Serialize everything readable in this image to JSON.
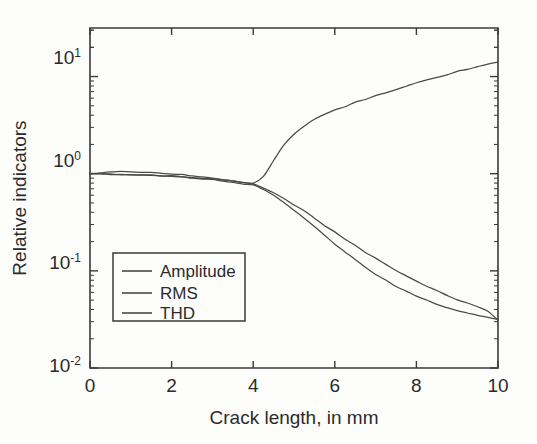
{
  "chart_data": {
    "type": "line",
    "title": "",
    "xlabel": "Crack length, in mm",
    "ylabel": "Relative indicators",
    "xlim": [
      0,
      10
    ],
    "ylim": [
      0.01,
      31.6
    ],
    "yscale": "log",
    "xscale": "linear",
    "grid": false,
    "legend_position": "lower-left-inside",
    "xticks": [
      "0",
      "2",
      "4",
      "6",
      "8",
      "10"
    ],
    "xtick_values": [
      0,
      2,
      4,
      6,
      8,
      10
    ],
    "yticks": [
      "10",
      "10",
      "10",
      "10"
    ],
    "ytick_exponents": [
      "1",
      "0",
      "-1",
      "-2"
    ],
    "ytick_values": [
      10,
      1,
      0.1,
      0.01
    ],
    "x": [
      0,
      0.25,
      0.5,
      0.75,
      1,
      1.25,
      1.5,
      1.75,
      2,
      2.25,
      2.5,
      2.75,
      3,
      3.25,
      3.5,
      3.75,
      4,
      4.25,
      4.5,
      4.75,
      5,
      5.25,
      5.5,
      5.75,
      6,
      6.25,
      6.5,
      6.75,
      7,
      7.25,
      7.5,
      7.75,
      8,
      8.25,
      8.5,
      8.75,
      9,
      9.25,
      9.5,
      9.75,
      10
    ],
    "series": [
      {
        "name": "Amplitude",
        "values": [
          1.0,
          1.02,
          1.04,
          1.05,
          1.05,
          1.04,
          1.03,
          1.01,
          0.99,
          0.97,
          0.95,
          0.93,
          0.9,
          0.87,
          0.84,
          0.81,
          0.78,
          0.72,
          0.64,
          0.56,
          0.48,
          0.41,
          0.35,
          0.295,
          0.25,
          0.213,
          0.182,
          0.156,
          0.134,
          0.116,
          0.101,
          0.0885,
          0.0782,
          0.0695,
          0.0622,
          0.0561,
          0.0509,
          0.0464,
          0.0424,
          0.0387,
          0.0313
        ]
      },
      {
        "name": "RMS",
        "values": [
          1.0,
          0.995,
          0.99,
          0.985,
          0.98,
          0.972,
          0.963,
          0.952,
          0.94,
          0.925,
          0.908,
          0.888,
          0.866,
          0.842,
          0.816,
          0.79,
          0.765,
          0.695,
          0.6,
          0.505,
          0.42,
          0.345,
          0.283,
          0.232,
          0.19,
          0.157,
          0.13,
          0.109,
          0.0925,
          0.0795,
          0.0692,
          0.0612,
          0.0548,
          0.0497,
          0.0455,
          0.042,
          0.0392,
          0.0368,
          0.0348,
          0.0332,
          0.0315
        ]
      },
      {
        "name": "THD",
        "values": [
          1.0,
          0.995,
          0.99,
          0.985,
          0.98,
          0.973,
          0.965,
          0.955,
          0.944,
          0.93,
          0.915,
          0.898,
          0.878,
          0.857,
          0.835,
          0.812,
          0.8,
          0.93,
          1.35,
          1.95,
          2.55,
          3.1,
          3.6,
          4.05,
          4.5,
          4.95,
          5.4,
          5.85,
          6.35,
          6.85,
          7.4,
          7.95,
          8.55,
          9.2,
          9.85,
          10.5,
          11.2,
          11.9,
          12.6,
          13.4,
          14.2
        ]
      }
    ],
    "legend": [
      {
        "label": "Amplitude",
        "style": "solid"
      },
      {
        "label": "RMS",
        "style": "solid"
      },
      {
        "label": "THD",
        "style": "solid"
      }
    ],
    "colors": {
      "line": "#4a4a4a",
      "axis": "#3a3a3a",
      "background": "#fdfdfb",
      "text": "#2b2b2b"
    }
  }
}
